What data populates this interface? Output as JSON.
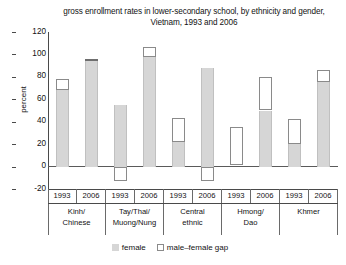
{
  "chart_data": {
    "type": "bar",
    "title": "gross enrollment rates in lower-secondary school, by ethnicity and gender, Vietnam, 1993 and 2006",
    "xlabel": "",
    "ylabel": "percent",
    "ylim": [
      -20,
      120
    ],
    "yticks": [
      120,
      100,
      80,
      60,
      40,
      20,
      0,
      -20
    ],
    "grid": false,
    "legend_position": "bottom",
    "groups": [
      "Kinh/ Chinese",
      "Tay/Thai/ Muong/Nung",
      "Central ethnic",
      "Hmong/ Dao",
      "Khmer"
    ],
    "categories": [
      "1993",
      "2006",
      "1993",
      "2006",
      "1993",
      "2006",
      "1993",
      "2006",
      "1993",
      "2006"
    ],
    "series": [
      {
        "name": "female",
        "values": [
          68,
          94,
          55,
          98,
          22,
          88,
          1,
          50,
          20,
          75
        ]
      },
      {
        "name": "male-female gap",
        "values": [
          10,
          2,
          -13,
          9,
          21,
          -13,
          34,
          30,
          22,
          11
        ]
      }
    ],
    "annotations": []
  },
  "axis": {
    "yticks": [
      {
        "label": "120",
        "value": 120
      },
      {
        "label": "100",
        "value": 100
      },
      {
        "label": "80",
        "value": 80
      },
      {
        "label": "60",
        "value": 60
      },
      {
        "label": "40",
        "value": 40
      },
      {
        "label": "20",
        "value": 20
      },
      {
        "label": "0",
        "value": 0
      },
      {
        "label": "-20",
        "value": -20
      }
    ],
    "ylabel": "percent"
  },
  "xaxis": {
    "years": [
      "1993",
      "2006",
      "1993",
      "2006",
      "1993",
      "2006",
      "1993",
      "2006",
      "1993",
      "2006"
    ],
    "groups": [
      {
        "line1": "Kinh/",
        "line2": "Chinese"
      },
      {
        "line1": "Tay/Thai/",
        "line2": "Muong/Nung"
      },
      {
        "line1": "Central",
        "line2": "ethnic"
      },
      {
        "line1": "Hmong/",
        "line2": "Dao"
      },
      {
        "line1": "Khmer",
        "line2": ""
      }
    ]
  },
  "legend": {
    "items": [
      {
        "label": "female",
        "color": "#d6d6d6"
      },
      {
        "label": "male–female gap",
        "color": "#ffffff"
      }
    ]
  },
  "title": {
    "line1": "gross enrollment rates in lower-secondary school, by ethnicity and",
    "line2": "gender, Vietnam, 1993 and 2006"
  },
  "colors": {
    "female_fill": "#d6d6d6",
    "gap_stroke": "#8a8a8a",
    "axis": "#4a4a4a",
    "text": "#121212"
  }
}
